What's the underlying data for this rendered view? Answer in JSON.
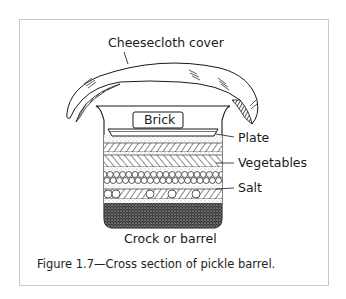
{
  "figure": {
    "caption": "Figure 1.7—Cross section of pickle barrel.",
    "labels": {
      "cover": "Cheesecloth cover",
      "brick": "Brick",
      "plate": "Plate",
      "vegetables": "Vegetables",
      "salt": "Salt",
      "container": "Crock or barrel"
    },
    "layers_top_to_bottom": [
      "brick",
      "plate",
      "salt",
      "vegetables",
      "salt",
      "vegetables",
      "salt",
      "vegetables",
      "salt (dense bottom)"
    ],
    "colors": {
      "ink": "#1a1a1a",
      "frame": "#c8c8c8",
      "background": "#ffffff"
    }
  }
}
